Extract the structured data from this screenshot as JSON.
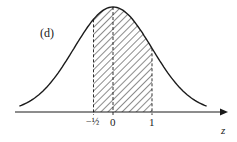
{
  "figure": {
    "panel_label": "(d)",
    "axis_variable": "z",
    "tick_labels": {
      "neg_half": "−½",
      "zero": "0",
      "one": "1"
    },
    "shaded_interval": {
      "from": -0.5,
      "to": 1
    },
    "colors": {
      "ink": "#1a1a1a",
      "background": "#ffffff"
    }
  },
  "chart_data": {
    "type": "area",
    "title": "(d)",
    "xlabel": "z",
    "ylabel": "",
    "x_ticks": [
      -0.5,
      0,
      1
    ],
    "x_tick_labels": [
      "−½",
      "0",
      "1"
    ],
    "shaded_region": [
      -0.5,
      1
    ],
    "dashed_verticals": [
      -0.5,
      0,
      1
    ],
    "grid": false,
    "legend": null
  }
}
